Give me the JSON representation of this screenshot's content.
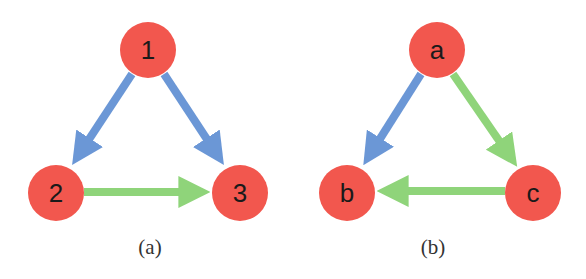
{
  "colors": {
    "node_fill": "#f2574e",
    "blue_edge": "#6b97d6",
    "green_edge": "#8fd47a"
  },
  "graphs": [
    {
      "caption": "(a)",
      "nodes": [
        {
          "id": "1",
          "label": "1",
          "cx": 148,
          "cy": 50
        },
        {
          "id": "2",
          "label": "2",
          "cx": 56,
          "cy": 193
        },
        {
          "id": "3",
          "label": "3",
          "cx": 240,
          "cy": 193
        }
      ],
      "edges": [
        {
          "from": "1",
          "to": "2",
          "color": "blue"
        },
        {
          "from": "1",
          "to": "3",
          "color": "blue"
        },
        {
          "from": "2",
          "to": "3",
          "color": "green"
        }
      ]
    },
    {
      "caption": "(b)",
      "nodes": [
        {
          "id": "a",
          "label": "a",
          "cx": 437,
          "cy": 50
        },
        {
          "id": "b",
          "label": "b",
          "cx": 347,
          "cy": 193
        },
        {
          "id": "c",
          "label": "c",
          "cx": 533,
          "cy": 193
        }
      ],
      "edges": [
        {
          "from": "a",
          "to": "b",
          "color": "blue"
        },
        {
          "from": "a",
          "to": "c",
          "color": "green"
        },
        {
          "from": "c",
          "to": "b",
          "color": "green"
        }
      ]
    }
  ]
}
